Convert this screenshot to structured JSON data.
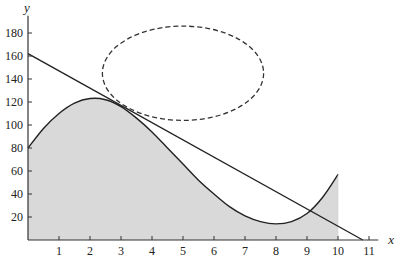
{
  "chart_data": {
    "type": "line",
    "title": "",
    "xlabel": "x",
    "ylabel": "y",
    "xlim": [
      0,
      11.3
    ],
    "ylim": [
      0,
      195
    ],
    "x_ticks": [
      1,
      2,
      3,
      4,
      5,
      6,
      7,
      8,
      9,
      10,
      11
    ],
    "y_ticks": [
      20,
      40,
      60,
      80,
      100,
      120,
      140,
      160,
      180
    ],
    "grid": false,
    "series": [
      {
        "name": "curve (shaded area beneath, 0 ≤ x ≤ 10)",
        "style": "solid",
        "fill": "#d9d9d9",
        "points": [
          [
            0,
            80
          ],
          [
            0.5,
            97
          ],
          [
            1,
            110
          ],
          [
            1.5,
            119
          ],
          [
            2,
            123
          ],
          [
            2.5,
            122
          ],
          [
            3,
            116
          ],
          [
            3.5,
            106
          ],
          [
            4,
            94
          ],
          [
            4.5,
            80
          ],
          [
            5,
            66
          ],
          [
            5.5,
            52
          ],
          [
            6,
            40
          ],
          [
            6.5,
            29
          ],
          [
            7,
            21
          ],
          [
            7.5,
            16
          ],
          [
            8,
            14
          ],
          [
            8.5,
            16
          ],
          [
            9,
            23
          ],
          [
            9.5,
            37
          ],
          [
            10,
            57
          ]
        ]
      },
      {
        "name": "tangent line",
        "style": "solid",
        "points": [
          [
            0,
            162
          ],
          [
            10.8,
            0
          ]
        ]
      },
      {
        "name": "dashed ellipse",
        "style": "dashed",
        "center": [
          5,
          145
        ],
        "radii": [
          2.6,
          41
        ]
      }
    ]
  }
}
